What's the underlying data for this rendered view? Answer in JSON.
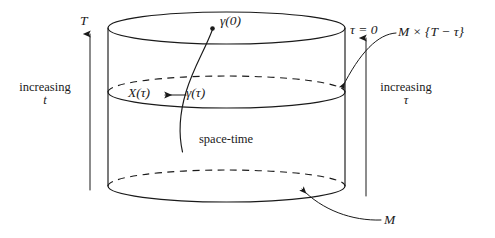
{
  "figure": {
    "type": "space-time cylinder diagram",
    "labels": {
      "top_axis": "T",
      "increasing_t_line1": "increasing",
      "increasing_t_line2": "t",
      "gamma_zero": "γ(0)",
      "x_tau": "X(τ)",
      "gamma_tau": "γ(τ)",
      "space_time": "space-time",
      "tau_zero": "τ = 0",
      "slice": "M × {T − τ}",
      "increasing_tau_line1": "increasing",
      "increasing_tau_line2": "τ",
      "manifold": "M"
    },
    "colors": {
      "ink": "#1a1a1a",
      "background": "#ffffff"
    },
    "geometry": {
      "cylinder_left_x": 108,
      "cylinder_right_x": 345,
      "top_ellipse_cy": 28,
      "mid_ellipse_cy": 92,
      "bottom_ellipse_cy": 186,
      "ellipse_ry": 16,
      "t_arrow": {
        "x": 90,
        "y_from": 190,
        "y_to": 32,
        "direction": "up"
      },
      "tau_arrow": {
        "x": 366,
        "y_from": 38,
        "y_to": 196,
        "direction": "down"
      }
    }
  }
}
